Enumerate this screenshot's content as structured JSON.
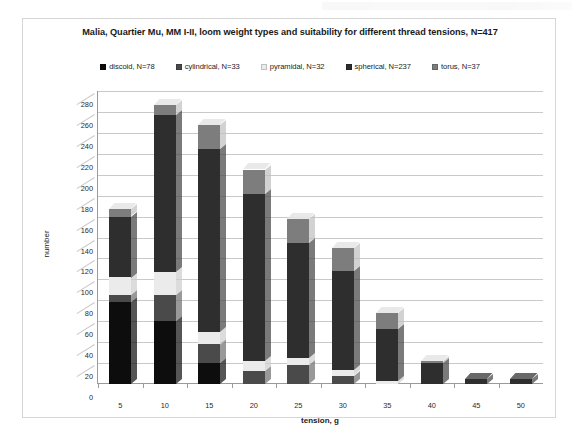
{
  "chart": {
    "title": "Malia, Quartier Mu, MM I-II, loom weight types and suitability for different thread tensions, N=417"
  },
  "chart_data": {
    "type": "bar",
    "subtype": "stacked-column-3d",
    "title": "Malia, Quartier Mu, MM I-II, loom weight types and suitability for different thread tensions, N=417",
    "xlabel": "tension, g",
    "ylabel": "number",
    "categories": [
      "5",
      "10",
      "15",
      "20",
      "25",
      "30",
      "35",
      "40",
      "45",
      "50"
    ],
    "ylim": [
      0,
      280
    ],
    "ytick_step": 20,
    "yticks": [
      0,
      20,
      40,
      60,
      80,
      100,
      120,
      140,
      160,
      180,
      200,
      220,
      240,
      260,
      280
    ],
    "grid": true,
    "legend_position": "top",
    "total_n": 417,
    "series": [
      {
        "name": "discoid",
        "legend_label": "discoid, N=78",
        "n": 78,
        "color": "#0d0d0d",
        "values": [
          78,
          60,
          20,
          0,
          0,
          0,
          0,
          0,
          0,
          0
        ]
      },
      {
        "name": "cylindrical",
        "legend_label": "cylindrical, N=33",
        "n": 33,
        "color": "#4a4a4a",
        "values": [
          7,
          25,
          18,
          12,
          18,
          8,
          0,
          0,
          0,
          0
        ]
      },
      {
        "name": "pyramidal",
        "legend_label": "pyramidal, N=32",
        "n": 32,
        "color": "#ebebeb",
        "values": [
          17,
          22,
          12,
          10,
          7,
          5,
          3,
          0,
          0,
          0
        ]
      },
      {
        "name": "spherical",
        "legend_label": "spherical, N=237",
        "n": 237,
        "color": "#2e2e2e",
        "values": [
          58,
          150,
          175,
          160,
          110,
          95,
          50,
          20,
          5,
          5
        ]
      },
      {
        "name": "torus",
        "legend_label": "torus, N=37",
        "n": 37,
        "color": "#7d7d7d",
        "values": [
          7,
          10,
          23,
          23,
          23,
          22,
          15,
          2,
          0,
          0
        ]
      }
    ],
    "totals": [
      167,
      267,
      248,
      205,
      158,
      130,
      68,
      22,
      5,
      5
    ]
  }
}
